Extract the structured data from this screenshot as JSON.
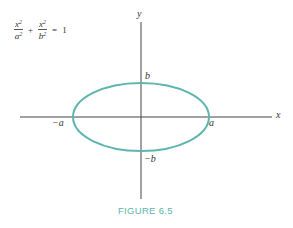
{
  "equation": {
    "term1": {
      "numerator": "x",
      "num_exp": "2",
      "denominator": "a",
      "den_exp": "2"
    },
    "plus": "+",
    "term2": {
      "numerator": "x",
      "num_exp": "2",
      "denominator": "b",
      "den_exp": "2"
    },
    "equals": "=",
    "rhs": "1"
  },
  "axes": {
    "x_label": "x",
    "y_label": "y"
  },
  "points": {
    "pos_a": "a",
    "neg_a": "−a",
    "pos_b": "b",
    "neg_b": "−b"
  },
  "ellipse": {
    "color": "#5db5ad",
    "cx": 141,
    "cy": 117,
    "rx": 68,
    "ry": 34
  },
  "caption": "FIGURE 6.5"
}
